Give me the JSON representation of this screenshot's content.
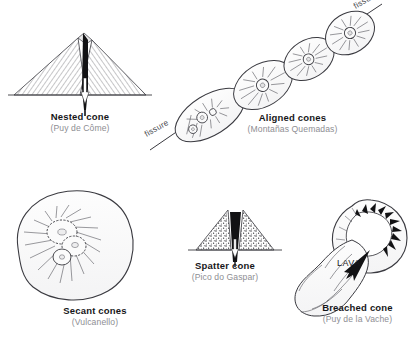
{
  "figure": {
    "background_color": "#ffffff",
    "ink_color": "#3a3a40",
    "caption_title_color": "#17171a",
    "caption_sub_color": "#8e8e93"
  },
  "diagrams": [
    {
      "id": "nested-cone",
      "title": "Nested cone",
      "locality": "(Puy de Côme)",
      "annotations": []
    },
    {
      "id": "aligned-cones",
      "title": "Aligned cones",
      "locality": "(Montañas Quemadas)",
      "annotations": [
        "fissure",
        "fissure"
      ],
      "cone_count": 4
    },
    {
      "id": "secant-cones",
      "title": "Secant cones",
      "locality": "(Vulcanello)",
      "annotations": []
    },
    {
      "id": "spatter-cone",
      "title": "Spatter cone",
      "locality": "(Pico do Gaspar)",
      "annotations": []
    },
    {
      "id": "breached-cone",
      "title": "Breached cone",
      "locality": "(Puy de la Vache)",
      "annotations": [
        "LAVA"
      ]
    }
  ],
  "labels": {
    "fissure_top": "fissure",
    "fissure_bottom": "fissure",
    "lava": "LAVA"
  }
}
